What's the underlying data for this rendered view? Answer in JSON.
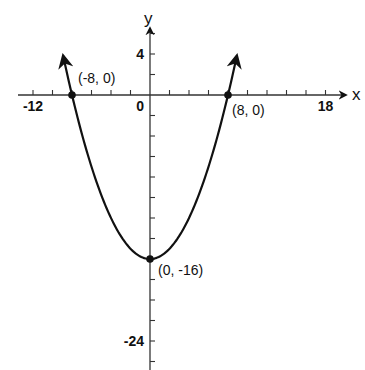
{
  "chart_data": {
    "type": "line",
    "title": "",
    "function": "y = x^2/4 - 16",
    "xlabel": "x",
    "ylabel": "y",
    "xlim": [
      -14,
      20
    ],
    "ylim": [
      -26,
      7
    ],
    "grid": false,
    "x_tick_step": 2,
    "y_tick_step": 2,
    "x_tick_labels": [
      {
        "value": -12,
        "label": "-12"
      },
      {
        "value": 0,
        "label": "0"
      },
      {
        "value": 18,
        "label": "18"
      }
    ],
    "y_tick_labels": [
      {
        "value": 4,
        "label": "4"
      },
      {
        "value": -24,
        "label": "-24"
      }
    ],
    "series": [
      {
        "name": "parabola",
        "x": [
          -8.9,
          -8,
          -6,
          -4,
          -2,
          0,
          2,
          4,
          6,
          8,
          8.9
        ],
        "y": [
          3.8,
          0,
          -7,
          -12,
          -15,
          -16,
          -15,
          -12,
          -7,
          0,
          3.8
        ]
      }
    ],
    "annotations": [
      {
        "x": -8,
        "y": 0,
        "label": "(-8, 0)"
      },
      {
        "x": 8,
        "y": 0,
        "label": "(8, 0)"
      },
      {
        "x": 0,
        "y": -16,
        "label": "(0, -16)"
      }
    ],
    "colors": {
      "line": "#111111",
      "axis": "#333333",
      "background": "#ffffff"
    }
  }
}
